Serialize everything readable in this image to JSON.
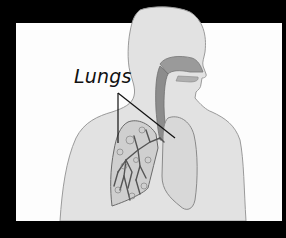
{
  "diagram": {
    "type": "anatomical-illustration",
    "labels": [
      {
        "text": "Lungs",
        "targets": [
          "left-lung-cutaway",
          "right-lung"
        ]
      }
    ],
    "colors": {
      "frame": "#000000",
      "background": "#fdfdfd",
      "body": "#e2e2e2",
      "body_outline": "#9a9a9a",
      "airway": "#8c8c8c",
      "lung_fill": "#d6d6d6",
      "bronchi": "#555555",
      "leader_lines": "#111111"
    }
  }
}
